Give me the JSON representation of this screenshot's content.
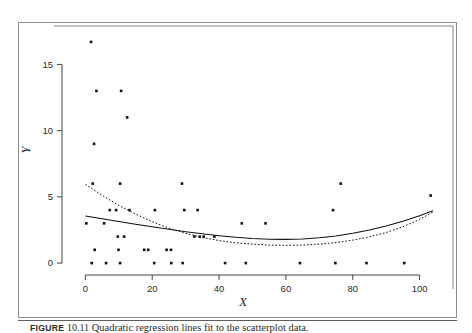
{
  "figure": {
    "caption_label": "FIGURE",
    "caption_number": "10.11",
    "caption_text": "Quadratic regression lines fit to the scatterplot data."
  },
  "chart_data": {
    "type": "scatter",
    "title": "",
    "xlabel": "X",
    "ylabel": "Y",
    "xlim": [
      -4,
      107
    ],
    "ylim": [
      -0.9,
      17.6
    ],
    "xticks": [
      0,
      20,
      40,
      60,
      80,
      100
    ],
    "yticks": [
      0,
      5,
      10,
      15
    ],
    "grid": false,
    "legend": "none",
    "points": [
      [
        1.7,
        16.7
      ],
      [
        3.3,
        13.0
      ],
      [
        10.7,
        13.0
      ],
      [
        12.5,
        11.0
      ],
      [
        2.6,
        9.0
      ],
      [
        2.2,
        6.0
      ],
      [
        10.4,
        6.0
      ],
      [
        28.9,
        6.0
      ],
      [
        76.4,
        6.0
      ],
      [
        103.3,
        5.1
      ],
      [
        7.3,
        4.0
      ],
      [
        9.2,
        4.0
      ],
      [
        13.2,
        4.0
      ],
      [
        20.8,
        4.0
      ],
      [
        29.6,
        4.0
      ],
      [
        33.6,
        4.0
      ],
      [
        74.1,
        4.0
      ],
      [
        0.3,
        3.0
      ],
      [
        5.6,
        3.0
      ],
      [
        46.8,
        3.0
      ],
      [
        53.9,
        3.0
      ],
      [
        9.7,
        2.0
      ],
      [
        11.6,
        2.0
      ],
      [
        32.6,
        2.0
      ],
      [
        34.2,
        2.0
      ],
      [
        35.4,
        2.0
      ],
      [
        38.6,
        2.0
      ],
      [
        2.8,
        1.0
      ],
      [
        9.9,
        1.0
      ],
      [
        17.6,
        1.0
      ],
      [
        18.8,
        1.0
      ],
      [
        24.3,
        1.0
      ],
      [
        25.6,
        1.0
      ],
      [
        1.9,
        0.0
      ],
      [
        6.2,
        0.0
      ],
      [
        10.4,
        0.0
      ],
      [
        20.6,
        0.0
      ],
      [
        25.7,
        0.0
      ],
      [
        29.1,
        0.0
      ],
      [
        41.8,
        0.0
      ],
      [
        48.0,
        0.0
      ],
      [
        64.2,
        0.0
      ],
      [
        74.8,
        0.0
      ],
      [
        84.1,
        0.0
      ],
      [
        95.4,
        0.0
      ]
    ],
    "series": [
      {
        "name": "quadratic fit (all data)",
        "style": "solid",
        "type": "curve",
        "x": [
          0,
          5,
          10,
          15,
          20,
          25,
          30,
          35,
          40,
          45,
          50,
          55,
          60,
          65,
          70,
          75,
          80,
          85,
          90,
          95,
          100,
          104
        ],
        "y": [
          3.55,
          3.35,
          3.14,
          2.94,
          2.74,
          2.55,
          2.37,
          2.21,
          2.07,
          1.95,
          1.86,
          1.8,
          1.79,
          1.82,
          1.91,
          2.05,
          2.25,
          2.5,
          2.8,
          3.16,
          3.58,
          3.95
        ]
      },
      {
        "name": "quadratic fit (outliers omitted)",
        "style": "dashed",
        "type": "curve",
        "x": [
          0,
          5,
          10,
          15,
          20,
          25,
          30,
          35,
          40,
          45,
          50,
          55,
          60,
          65,
          70,
          75,
          80,
          85,
          90,
          95,
          100,
          104
        ],
        "y": [
          5.95,
          5.12,
          4.36,
          3.7,
          3.12,
          2.63,
          2.24,
          1.93,
          1.7,
          1.53,
          1.43,
          1.36,
          1.34,
          1.36,
          1.43,
          1.55,
          1.73,
          1.98,
          2.31,
          2.74,
          3.3,
          3.85
        ]
      }
    ]
  }
}
